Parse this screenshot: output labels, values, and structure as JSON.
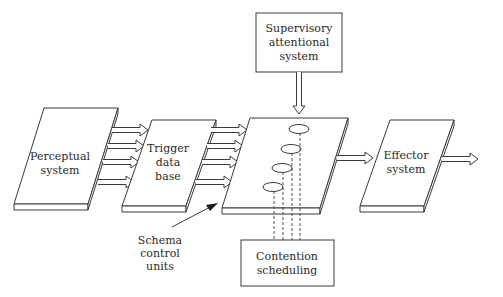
{
  "diagram": {
    "nodes": {
      "perceptual": {
        "lines": [
          "Perceptual",
          "system"
        ]
      },
      "trigger": {
        "lines": [
          "Trigger",
          "data",
          "base"
        ]
      },
      "effector": {
        "lines": [
          "Effector",
          "system"
        ]
      },
      "supervisory": {
        "lines": [
          "Supervisory",
          "attentional",
          "system"
        ]
      },
      "contention": {
        "lines": [
          "Contention",
          "scheduling"
        ]
      }
    },
    "annotation": {
      "lines": [
        "Schema",
        "control",
        "units"
      ]
    },
    "colors": {
      "stroke": "#3a3a3a",
      "background": "#ffffff",
      "text": "#2a2a2a"
    }
  }
}
